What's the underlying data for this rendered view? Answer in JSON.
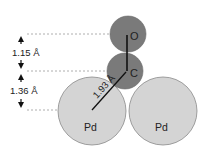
{
  "diagram": {
    "atoms": [
      {
        "id": "O",
        "label": "O",
        "cx": 128,
        "cy": 34,
        "r": 18,
        "fill": "#7a7a7a"
      },
      {
        "id": "C",
        "label": "C",
        "cx": 125,
        "cy": 71,
        "r": 18,
        "fill": "#7a7a7a"
      },
      {
        "id": "Pd1",
        "label": "Pd",
        "cx": 92,
        "cy": 111,
        "r": 34,
        "fill": "#d4d4d4"
      },
      {
        "id": "Pd2",
        "label": "Pd",
        "cx": 163,
        "cy": 111,
        "r": 34,
        "fill": "#d4d4d4"
      }
    ],
    "distances": {
      "co": "1.15 Å",
      "c_height": "1.36 Å",
      "c_pd": "1.93 Å"
    },
    "colors": {
      "adsorbate": "#7a7a7a",
      "metal": "#d4d4d4",
      "outline": "#888888",
      "line": "#111111"
    }
  }
}
